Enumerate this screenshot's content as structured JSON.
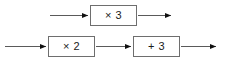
{
  "diagram": {
    "type": "function-machine-flow",
    "width": 226,
    "height": 63,
    "background_color": "#ffffff",
    "box_border_color": "#6e6e6e",
    "box_fill_color": "#ffffff",
    "arrow_line_color": "#5a5a5a",
    "arrow_head_color": "#111111",
    "text_color": "#1a1a1a",
    "rows": [
      {
        "name": "top-row",
        "boxes": [
          {
            "id": "times-three",
            "label": "× 3",
            "x": 90,
            "y": 5,
            "width": 47,
            "height": 21
          }
        ],
        "arrows": [
          {
            "id": "top-input-arrow",
            "x1": 50,
            "y1": 15,
            "x2": 89,
            "y2": 15
          },
          {
            "id": "top-output-arrow",
            "x1": 138,
            "y1": 15,
            "x2": 172,
            "y2": 15
          }
        ]
      },
      {
        "name": "bottom-row",
        "boxes": [
          {
            "id": "times-two",
            "label": "× 2",
            "x": 48,
            "y": 36,
            "width": 47,
            "height": 21
          },
          {
            "id": "plus-three",
            "label": "+ 3",
            "x": 133,
            "y": 36,
            "width": 47,
            "height": 21
          }
        ],
        "arrows": [
          {
            "id": "bottom-input-arrow",
            "x1": 5,
            "y1": 46,
            "x2": 47,
            "y2": 46
          },
          {
            "id": "bottom-middle-arrow",
            "x1": 96,
            "y1": 46,
            "x2": 132,
            "y2": 46
          },
          {
            "id": "bottom-output-arrow",
            "x1": 181,
            "y1": 46,
            "x2": 217,
            "y2": 46
          }
        ]
      }
    ]
  }
}
